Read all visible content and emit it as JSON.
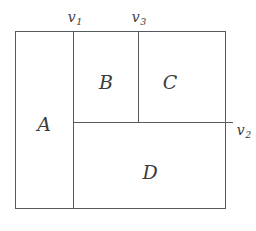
{
  "figure": {
    "line_color": "#555a5e",
    "text_color": "#3b3b3b",
    "background": "#ffffff",
    "regions": [
      {
        "id": "A",
        "label": "A"
      },
      {
        "id": "B",
        "label": "B"
      },
      {
        "id": "C",
        "label": "C"
      },
      {
        "id": "D",
        "label": "D"
      }
    ],
    "vertices": [
      {
        "id": "v1",
        "base": "v",
        "sub": "1"
      },
      {
        "id": "v2",
        "base": "v",
        "sub": "2"
      },
      {
        "id": "v3",
        "base": "v",
        "sub": "3"
      }
    ]
  }
}
